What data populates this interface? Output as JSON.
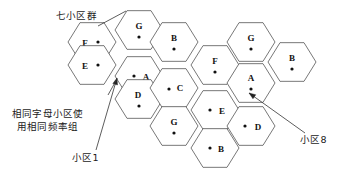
{
  "diagram": {
    "type": "cellular-frequency-reuse-hexagon-grid",
    "canvas": {
      "width": 344,
      "height": 175
    },
    "hex": {
      "radius": 24,
      "orientation": "flat-top"
    },
    "cells": [
      {
        "id": "c-f-1",
        "label": "F",
        "cx": 92,
        "cy": 42,
        "label_dx": -7,
        "label_dy": 2,
        "dot_dx": 6,
        "dot_dy": 0
      },
      {
        "id": "c-e-1",
        "label": "E",
        "cx": 92,
        "cy": 65,
        "label_dx": -7,
        "label_dy": 2,
        "dot_dx": 6,
        "dot_dy": 0
      },
      {
        "id": "c-g-1",
        "label": "G",
        "cx": 139,
        "cy": 30,
        "label_dx": 0,
        "label_dy": -3,
        "dot_dx": 0,
        "dot_dy": 7
      },
      {
        "id": "c-a-1",
        "label": "A",
        "cx": 139,
        "cy": 76,
        "label_dx": 7,
        "label_dy": 2,
        "dot_dx": -5,
        "dot_dy": 0
      },
      {
        "id": "c-d-1",
        "label": "D",
        "cx": 139,
        "cy": 99,
        "label_dx": -1,
        "label_dy": -3,
        "dot_dx": 0,
        "dot_dy": 7
      },
      {
        "id": "c-b-1",
        "label": "B",
        "cx": 174,
        "cy": 42,
        "label_dx": 0,
        "label_dy": -3,
        "dot_dx": 0,
        "dot_dy": 7
      },
      {
        "id": "c-c-1",
        "label": "C",
        "cx": 174,
        "cy": 88,
        "label_dx": 6,
        "label_dy": 1,
        "dot_dx": -5,
        "dot_dy": 1
      },
      {
        "id": "c-g-2",
        "label": "G",
        "cx": 174,
        "cy": 126,
        "label_dx": 0,
        "label_dy": -3,
        "dot_dx": 0,
        "dot_dy": 7
      },
      {
        "id": "c-f-2",
        "label": "F",
        "cx": 215,
        "cy": 65,
        "label_dx": 0,
        "label_dy": -3,
        "dot_dx": 0,
        "dot_dy": 7
      },
      {
        "id": "c-e-2",
        "label": "E",
        "cx": 215,
        "cy": 110,
        "label_dx": 7,
        "label_dy": 2,
        "dot_dx": -5,
        "dot_dy": 0
      },
      {
        "id": "c-b-2",
        "label": "B",
        "cx": 215,
        "cy": 148,
        "label_dx": 6,
        "label_dy": 2,
        "dot_dx": -5,
        "dot_dy": 0
      },
      {
        "id": "c-g-3",
        "label": "G",
        "cx": 251,
        "cy": 42,
        "label_dx": 0,
        "label_dy": -3,
        "dot_dx": 0,
        "dot_dy": 7
      },
      {
        "id": "c-a-2",
        "label": "A",
        "cx": 251,
        "cy": 83,
        "label_dx": 0,
        "label_dy": -4,
        "dot_dx": 0,
        "dot_dy": 6
      },
      {
        "id": "c-d-2",
        "label": "D",
        "cx": 251,
        "cy": 126,
        "label_dx": 7,
        "label_dy": 2,
        "dot_dx": -6,
        "dot_dy": 0
      },
      {
        "id": "c-b-3",
        "label": "B",
        "cx": 292,
        "cy": 62,
        "label_dx": 0,
        "label_dy": -3,
        "dot_dx": 0,
        "dot_dy": 7
      }
    ],
    "leaders": [
      {
        "id": "leader-cluster",
        "name": "cluster-leader-line",
        "path": "M 98 26 L 126 11",
        "arrow": null
      },
      {
        "id": "leader-cell1-a",
        "name": "cell1-leader-line-a",
        "path": "M 96 150 L 117 78",
        "arrow": {
          "tip_x": 117,
          "tip_y": 78,
          "angle": -74
        }
      },
      {
        "id": "leader-cell1-b",
        "name": "cell1-leader-line-b",
        "path": "M 108 95 L 117 79",
        "arrow": null
      },
      {
        "id": "leader-cell8",
        "name": "cell8-leader-line",
        "path": "M 305 133 L 249 93",
        "arrow": {
          "tip_x": 249,
          "tip_y": 93,
          "angle": 215
        }
      }
    ]
  },
  "annotations": {
    "cluster_label": "七小区群",
    "note_line1": "相同字母小区使",
    "note_line2": "用相同频率组",
    "cell1_label": "小区1",
    "cell8_label": "小区8"
  },
  "colors": {
    "hex_stroke": "#555555",
    "hex_fill": "#ffffff",
    "text": "#111111",
    "leader": "#333333",
    "background": "#ffffff"
  }
}
